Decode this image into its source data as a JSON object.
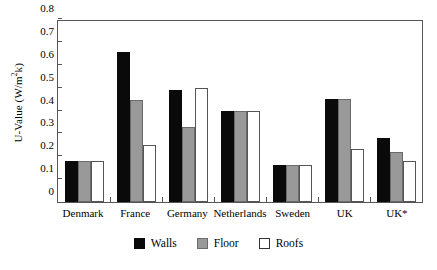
{
  "chart_data": {
    "type": "bar",
    "title": "",
    "xlabel": "",
    "ylabel": "U-Value (W/m2k)",
    "ylabel_prefix": "U-Value (W/m",
    "ylabel_sup": "2",
    "ylabel_suffix": "k)",
    "categories": [
      "Denmark",
      "France",
      "Germany",
      "Netherlands",
      "Sweden",
      "UK",
      "UK*"
    ],
    "series": [
      {
        "name": "Walls",
        "color": "#0a0a0a",
        "values": [
          0.18,
          0.655,
          0.49,
          0.4,
          0.16,
          0.45,
          0.28
        ]
      },
      {
        "name": "Floor",
        "color": "#999999",
        "values": [
          0.18,
          0.445,
          0.33,
          0.4,
          0.16,
          0.45,
          0.22
        ]
      },
      {
        "name": "Roofs",
        "color": "#ffffff",
        "values": [
          0.18,
          0.25,
          0.5,
          0.4,
          0.16,
          0.23,
          0.18
        ]
      }
    ],
    "ylim": [
      0,
      0.8
    ],
    "yticks": [
      0,
      0.1,
      0.2,
      0.3,
      0.4,
      0.5,
      0.6,
      0.7,
      0.8
    ],
    "ytick_labels": [
      "0",
      "0.1",
      "0.2",
      "0.3",
      "0.4",
      "0.5",
      "0.6",
      "0.7",
      "0.8"
    ],
    "grid": false,
    "legend_position": "bottom"
  }
}
